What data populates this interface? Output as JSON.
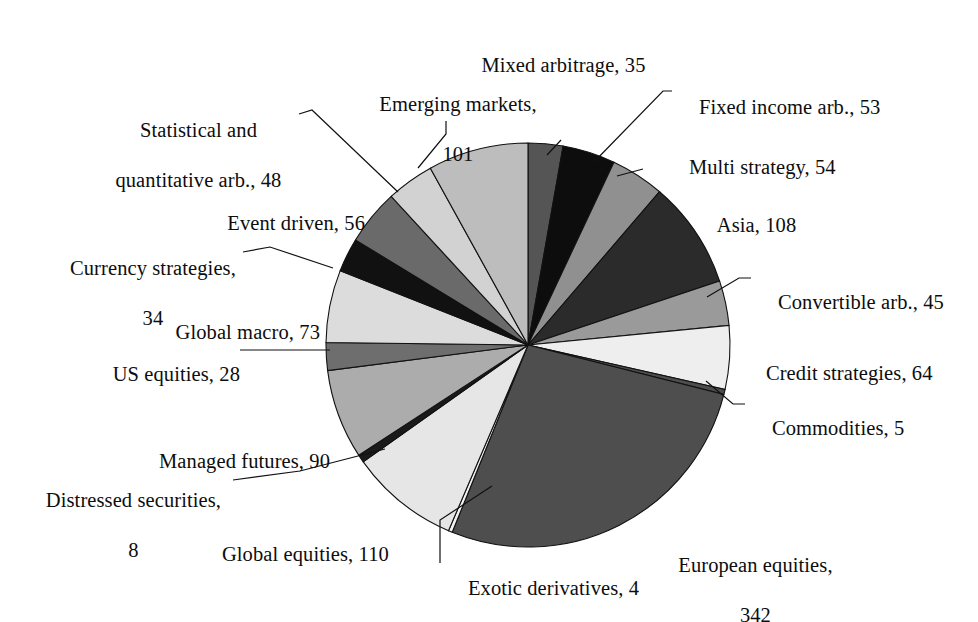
{
  "chart_data": {
    "type": "pie",
    "title": "",
    "subtitle": "",
    "xlabel": "",
    "ylabel": "",
    "legend_position": "none",
    "grid": false,
    "label_format": "name, value",
    "total": 1258,
    "start_angle_deg": 0,
    "direction": "clockwise",
    "categories": [
      "Mixed arbitrage",
      "Fixed income arb.",
      "Multi strategy",
      "Asia",
      "Convertible arb.",
      "Credit strategies",
      "Commodities",
      "European equities",
      "Exotic derivatives",
      "Global equities",
      "Distressed securities",
      "Managed futures",
      "US equities",
      "Global macro",
      "Currency strategies",
      "Event driven",
      "Statistical and quantitative arb.",
      "Emerging markets"
    ],
    "values": [
      35,
      53,
      54,
      108,
      45,
      64,
      5,
      342,
      4,
      110,
      8,
      90,
      28,
      73,
      34,
      56,
      48,
      101
    ],
    "colors": [
      "#555555",
      "#0d0d0d",
      "#909090",
      "#2b2b2b",
      "#9a9a9a",
      "#eeeeee",
      "#4d4d4d",
      "#4e4e4e",
      "#f2f2f2",
      "#e6e6e6",
      "#1a1a1a",
      "#acacac",
      "#6e6e6e",
      "#dcdcdc",
      "#111111",
      "#6a6a6a",
      "#d2d2d2",
      "#bdbdbd"
    ],
    "slices": [
      {
        "name": "Mixed arbitrage",
        "value": 35,
        "label": "Mixed arbitrage, 35",
        "color": "#555555"
      },
      {
        "name": "Fixed income arb.",
        "value": 53,
        "label": "Fixed income arb., 53",
        "color": "#0d0d0d"
      },
      {
        "name": "Multi strategy",
        "value": 54,
        "label": "Multi strategy, 54",
        "color": "#909090"
      },
      {
        "name": "Asia",
        "value": 108,
        "label": "Asia, 108",
        "color": "#2b2b2b"
      },
      {
        "name": "Convertible arb.",
        "value": 45,
        "label": "Convertible arb., 45",
        "color": "#9a9a9a"
      },
      {
        "name": "Credit strategies",
        "value": 64,
        "label": "Credit strategies, 64",
        "color": "#eeeeee"
      },
      {
        "name": "Commodities",
        "value": 5,
        "label": "Commodities, 5",
        "color": "#4d4d4d"
      },
      {
        "name": "European equities",
        "value": 342,
        "label": "European equities, 342",
        "color": "#4e4e4e"
      },
      {
        "name": "Exotic derivatives",
        "value": 4,
        "label": "Exotic derivatives, 4",
        "color": "#f2f2f2"
      },
      {
        "name": "Global equities",
        "value": 110,
        "label": "Global equities, 110",
        "color": "#e6e6e6"
      },
      {
        "name": "Distressed securities",
        "value": 8,
        "label": "Distressed securities, 8",
        "color": "#1a1a1a"
      },
      {
        "name": "Managed futures",
        "value": 90,
        "label": "Managed futures, 90",
        "color": "#acacac"
      },
      {
        "name": "US equities",
        "value": 28,
        "label": "US equities, 28",
        "color": "#6e6e6e"
      },
      {
        "name": "Global macro",
        "value": 73,
        "label": "Global macro, 73",
        "color": "#dcdcdc"
      },
      {
        "name": "Currency strategies",
        "value": 34,
        "label": "Currency strategies, 34",
        "color": "#111111"
      },
      {
        "name": "Event driven",
        "value": 56,
        "label": "Event driven, 56",
        "color": "#6a6a6a"
      },
      {
        "name": "Statistical and quantitative arb.",
        "value": 48,
        "label": "Statistical and quantitative arb., 48",
        "color": "#d2d2d2"
      },
      {
        "name": "Emerging markets",
        "value": 101,
        "label": "Emerging markets, 101",
        "color": "#bdbdbd"
      }
    ]
  },
  "labels": {
    "mixed_arbitrage": "Mixed arbitrage, 35",
    "fixed_income_arb": "Fixed income arb., 53",
    "multi_strategy": "Multi strategy, 54",
    "asia": "Asia, 108",
    "convertible_arb": "Convertible arb., 45",
    "credit_strategies": "Credit strategies, 64",
    "commodities": "Commodities, 5",
    "european_equities_line1": "European equities,",
    "european_equities_line2": "342",
    "exotic_derivatives": "Exotic derivatives, 4",
    "global_equities": "Global equities, 110",
    "distressed_securities_line1": "Distressed securities,",
    "distressed_securities_line2": "8",
    "managed_futures": "Managed futures, 90",
    "us_equities": "US equities, 28",
    "global_macro": "Global macro, 73",
    "currency_strategies_line1": "Currency strategies,",
    "currency_strategies_line2": "34",
    "event_driven": "Event driven, 56",
    "statistical_arb_line1": "Statistical and",
    "statistical_arb_line2": "quantitative arb., 48",
    "emerging_markets_line1": "Emerging markets,",
    "emerging_markets_line2": "101"
  }
}
